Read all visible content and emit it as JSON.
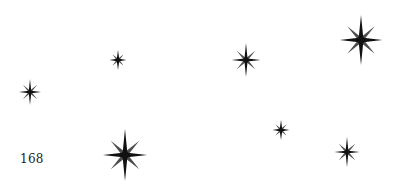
{
  "page": {
    "number": "168"
  },
  "stars": [
    {
      "cx": 30,
      "cy": 92,
      "size": 26
    },
    {
      "cx": 118,
      "cy": 60,
      "size": 20
    },
    {
      "cx": 246,
      "cy": 60,
      "size": 34
    },
    {
      "cx": 361,
      "cy": 40,
      "size": 50
    },
    {
      "cx": 281,
      "cy": 130,
      "size": 20
    },
    {
      "cx": 347,
      "cy": 152,
      "size": 30
    },
    {
      "cx": 125,
      "cy": 155,
      "size": 52
    }
  ],
  "colors": {
    "star": "#111111",
    "background": "#ffffff"
  }
}
